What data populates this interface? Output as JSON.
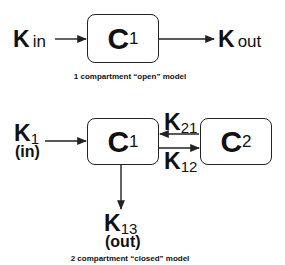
{
  "diagram_1": {
    "caption": "1 compartment “open” model",
    "compartment": {
      "letter": "C",
      "index": "1"
    },
    "input": {
      "letter": "K",
      "label": "in"
    },
    "output": {
      "letter": "K",
      "label": "out"
    }
  },
  "diagram_2": {
    "caption": "2 compartment “closed” model",
    "compartments": [
      {
        "letter": "C",
        "index": "1"
      },
      {
        "letter": "C",
        "index": "2"
      }
    ],
    "input": {
      "letter": "K",
      "index": "1",
      "note": "(in)"
    },
    "transfer_21": {
      "letter": "K",
      "index": "21"
    },
    "transfer_12": {
      "letter": "K",
      "index": "12"
    },
    "output": {
      "letter": "K",
      "index": "13",
      "note": "(out)"
    }
  }
}
